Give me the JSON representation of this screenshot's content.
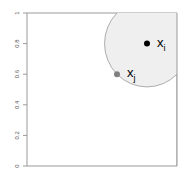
{
  "chart_data": {
    "type": "scatter",
    "title": "",
    "xlabel": "",
    "ylabel": "",
    "xlim": [
      0,
      1
    ],
    "ylim": [
      0,
      1
    ],
    "grid": false,
    "x_axis_visible": false,
    "y_ticks": [
      0,
      0.2,
      0.4,
      0.6,
      0.8,
      1
    ],
    "y_tick_labels": [
      "0",
      "0.2",
      "0.4",
      "0.6",
      "0.8",
      "1"
    ],
    "points": [
      {
        "name": "x_i",
        "label": "x",
        "subscript": "i",
        "x": 0.8,
        "y": 0.8,
        "color": "#000000"
      },
      {
        "name": "x_j",
        "label": "x",
        "subscript": "j",
        "x": 0.6,
        "y": 0.6,
        "color": "#808080"
      }
    ],
    "circle": {
      "center": "x_i",
      "radius": 0.283,
      "fill": "#efefef",
      "stroke": "#999999",
      "description": "neighborhood of x_i with radius equal to distance to x_j"
    },
    "frame_color": "#9a9a9a"
  }
}
